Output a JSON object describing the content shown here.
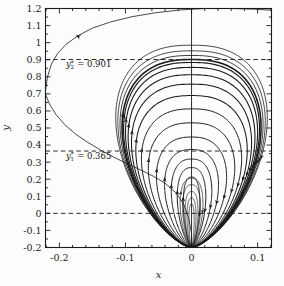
{
  "figure": {
    "width": 284,
    "height": 286,
    "background": "#fdfdfd",
    "curve_color": "#1b1b1b",
    "axis_color": "#1a1a1a",
    "dash_color": "#2a2a2a"
  },
  "chart_data": {
    "type": "line",
    "title": "",
    "xlabel": "x",
    "ylabel": "y",
    "xlim": [
      -0.221,
      0.121
    ],
    "ylim": [
      -0.2,
      1.2
    ],
    "grid": false,
    "legend": null,
    "xticks": [
      -0.2,
      -0.1,
      0,
      0.1
    ],
    "xticklabels": [
      "-0.2",
      "-0.1",
      "0",
      "0.1"
    ],
    "xminor_step": 0.02,
    "yticks": [
      -0.2,
      -0.1,
      0,
      0.1,
      0.2,
      0.3,
      0.4,
      0.5,
      0.6,
      0.7,
      0.8,
      0.9,
      1.0,
      1.1,
      1.2
    ],
    "yticklabels": [
      "-0.2",
      "-0.1",
      "0",
      "0.1",
      "0.2",
      "0.3",
      "0.4",
      "0.5",
      "0.6",
      "0.7",
      "0.8",
      "0.9",
      "1",
      "1.1",
      "1.2"
    ],
    "yminor_step": 0.05,
    "cusp_point": [
      0.0,
      -0.2
    ],
    "center_point": [
      0.0,
      0.36
    ],
    "flow_direction": "counterclockwise",
    "vertical_line_x": 0.0,
    "hlines": [
      {
        "y": 0.0,
        "style": "dashed",
        "label": null
      },
      {
        "y": 0.365,
        "style": "dashed",
        "label": "y1*"
      },
      {
        "y": 0.901,
        "style": "dashed",
        "label": "y2*"
      }
    ],
    "annotations": [
      {
        "text_main": "= 0.901",
        "var": "y",
        "sub": "2",
        "sup": "*",
        "x": -0.19,
        "y": 0.855
      },
      {
        "text_main": "= 0.365",
        "var": "y",
        "sub": "1",
        "sup": "*",
        "x": -0.19,
        "y": 0.318
      }
    ],
    "orbits": [
      {
        "name": "orbit-1",
        "top": 0.213,
        "amp_x": 0.0125,
        "lobe": 0.62,
        "width": 1.0,
        "arrows": 2
      },
      {
        "name": "orbit-2",
        "top": 0.268,
        "amp_x": 0.0215,
        "lobe": 0.62,
        "width": 1.0,
        "arrows": 2
      },
      {
        "name": "orbit-3",
        "top": 0.318,
        "amp_x": 0.0305,
        "lobe": 0.62,
        "width": 1.0,
        "arrows": 2
      },
      {
        "name": "orbit-4",
        "top": 0.374,
        "amp_x": 0.0405,
        "lobe": 0.63,
        "width": 1.0,
        "arrows": 2
      },
      {
        "name": "orbit-5",
        "top": 0.447,
        "amp_x": 0.0525,
        "lobe": 0.64,
        "width": 1.0,
        "arrows": 2
      },
      {
        "name": "orbit-6",
        "top": 0.53,
        "amp_x": 0.0645,
        "lobe": 0.65,
        "width": 1.0,
        "arrows": 2
      },
      {
        "name": "orbit-7",
        "top": 0.612,
        "amp_x": 0.0745,
        "lobe": 0.66,
        "width": 1.0,
        "arrows": 2
      },
      {
        "name": "orbit-8",
        "top": 0.69,
        "amp_x": 0.0825,
        "lobe": 0.67,
        "width": 1.05,
        "arrows": 2
      },
      {
        "name": "orbit-9",
        "top": 0.757,
        "amp_x": 0.0885,
        "lobe": 0.68,
        "width": 1.05,
        "arrows": 2
      },
      {
        "name": "orbit-10",
        "top": 0.812,
        "amp_x": 0.093,
        "lobe": 0.69,
        "width": 1.1,
        "arrows": 2
      },
      {
        "name": "orbit-11",
        "top": 0.855,
        "amp_x": 0.0963,
        "lobe": 0.7,
        "width": 1.1,
        "arrows": 2
      },
      {
        "name": "orbit-12",
        "top": 0.884,
        "amp_x": 0.0985,
        "lobe": 0.71,
        "width": 1.15,
        "arrows": 2
      },
      {
        "name": "orbit-13",
        "top": 0.901,
        "amp_x": 0.1,
        "lobe": 0.72,
        "width": 1.6,
        "arrows": 2
      },
      {
        "name": "orbit-14",
        "top": 0.925,
        "amp_x": 0.1022,
        "lobe": 0.73,
        "width": 0.85,
        "arrows": 1
      },
      {
        "name": "orbit-15",
        "top": 0.952,
        "amp_x": 0.1045,
        "lobe": 0.74,
        "width": 0.8,
        "arrows": 1
      },
      {
        "name": "orbit-16",
        "top": 0.985,
        "amp_x": 0.1065,
        "lobe": 0.75,
        "width": 0.8,
        "arrows": 1
      }
    ],
    "inner_orbits": [
      {
        "name": "inner-orbit-1",
        "top": 0.055,
        "amp_x": 0.004,
        "width": 0.7
      },
      {
        "name": "inner-orbit-2",
        "top": 0.09,
        "amp_x": 0.0068,
        "width": 0.7
      },
      {
        "name": "inner-orbit-3",
        "top": 0.128,
        "amp_x": 0.0098,
        "width": 0.7
      },
      {
        "name": "inner-orbit-4",
        "top": 0.168,
        "amp_x": 0.0135,
        "width": 0.7
      },
      {
        "name": "inner-orbit-5",
        "top": 0.205,
        "amp_x": 0.0172,
        "width": 0.7
      }
    ],
    "separatrix": {
      "name": "outer-separatrix",
      "points": [
        [
          -0.2215,
          0.705
        ],
        [
          -0.218,
          0.8
        ],
        [
          -0.212,
          0.875
        ],
        [
          -0.203,
          0.935
        ],
        [
          -0.19,
          0.99
        ],
        [
          -0.172,
          1.04
        ],
        [
          -0.15,
          1.085
        ],
        [
          -0.122,
          1.122
        ],
        [
          -0.09,
          1.152
        ],
        [
          -0.055,
          1.175
        ],
        [
          -0.016,
          1.192
        ],
        [
          0.02,
          1.2
        ],
        [
          0.06,
          1.2
        ],
        [
          0.095,
          1.196
        ],
        [
          0.121,
          1.19
        ]
      ],
      "arrows": [
        {
          "x": -0.175,
          "y": 1.043,
          "angle": 205
        }
      ]
    },
    "inflow_branch": {
      "name": "lower-left-inflow",
      "points": [
        [
          -0.2215,
          0.705
        ],
        [
          -0.215,
          0.64
        ],
        [
          -0.205,
          0.578
        ],
        [
          -0.192,
          0.52
        ],
        [
          -0.176,
          0.466
        ],
        [
          -0.158,
          0.418
        ],
        [
          -0.138,
          0.372
        ],
        [
          -0.118,
          0.33
        ],
        [
          -0.098,
          0.292
        ],
        [
          -0.078,
          0.256
        ],
        [
          -0.058,
          0.218
        ],
        [
          -0.04,
          0.176
        ],
        [
          -0.024,
          0.122
        ],
        [
          -0.012,
          0.055
        ],
        [
          -0.004,
          -0.03
        ],
        [
          0.0,
          -0.12
        ],
        [
          0.0,
          -0.2
        ]
      ]
    }
  }
}
